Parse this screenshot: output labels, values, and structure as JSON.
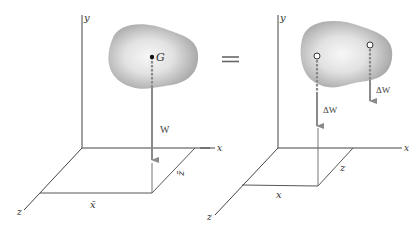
{
  "figure": {
    "equals_sign": "=",
    "left_panel": {
      "axis_labels": {
        "y": "y",
        "x": "x",
        "z": "z"
      },
      "point_label": "G",
      "force_label": "W",
      "coord_labels": {
        "x_bar": "x̄",
        "z_bar": "z̄"
      }
    },
    "right_panel": {
      "axis_labels": {
        "y": "y",
        "x": "x",
        "z": "z"
      },
      "force_labels": [
        "ΔW",
        "ΔW"
      ],
      "coord_labels": {
        "x": "x",
        "z": "z"
      }
    },
    "colors": {
      "axis": "#444444",
      "arrow": "#8a8a8a",
      "blob_edge": "#9a9a9a",
      "blob_center": "#f2f2f2"
    }
  }
}
